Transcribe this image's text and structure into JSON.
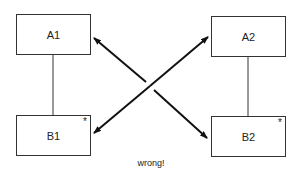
{
  "diagram": {
    "nodes": [
      {
        "id": "A1",
        "label": "A1",
        "marked": false
      },
      {
        "id": "B1",
        "label": "B1",
        "marked": true
      },
      {
        "id": "A2",
        "label": "A2",
        "marked": false
      },
      {
        "id": "B2",
        "label": "B2",
        "marked": true
      }
    ],
    "marker": "*",
    "edges": [
      {
        "from": "A1",
        "to": "B1",
        "type": "line"
      },
      {
        "from": "A2",
        "to": "B2",
        "type": "line"
      },
      {
        "from": "A1",
        "to": "B2",
        "type": "double-arrow"
      },
      {
        "from": "B1",
        "to": "A2",
        "type": "double-arrow"
      }
    ],
    "caption": "wrong!"
  }
}
